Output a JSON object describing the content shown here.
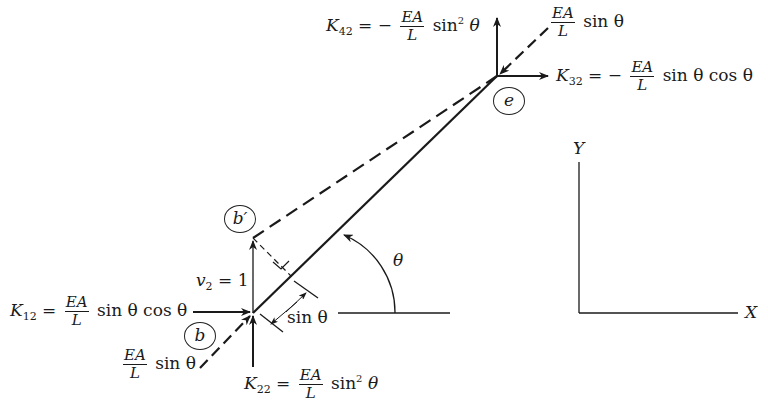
{
  "diagram": {
    "type": "truss-element-displacement",
    "nodes": {
      "b": {
        "label": "b"
      },
      "b_prime": {
        "label": "b′"
      },
      "e": {
        "label": "e"
      }
    },
    "displacement": {
      "var": "v",
      "sub": "2",
      "eq": "= 1"
    },
    "projection": {
      "text": "sin θ"
    },
    "angle": {
      "symbol": "θ"
    },
    "forces": {
      "K12": {
        "K": "K",
        "sub": "12",
        "eq": "=",
        "sign": "",
        "num": "EA",
        "den": "L",
        "tail": "sin θ cos θ"
      },
      "K22": {
        "K": "K",
        "sub": "22",
        "eq": "=",
        "sign": "",
        "num": "EA",
        "den": "L",
        "tail_pre": "sin",
        "sup": "2",
        "tail_post": "θ"
      },
      "K42": {
        "K": "K",
        "sub": "42",
        "eq": "=",
        "sign": "−",
        "num": "EA",
        "den": "L",
        "tail_pre": "sin",
        "sup": "2",
        "tail_post": "θ"
      },
      "K32": {
        "K": "K",
        "sub": "32",
        "eq": "=",
        "sign": "−",
        "num": "EA",
        "den": "L",
        "tail": "sin θ cos θ"
      },
      "axial_b": {
        "num": "EA",
        "den": "L",
        "tail": "sin θ"
      },
      "axial_e": {
        "num": "EA",
        "den": "L",
        "tail": "sin θ"
      }
    },
    "axes": {
      "x": "X",
      "y": "Y"
    },
    "colors": {
      "ink": "#1a1a1a",
      "background": "#ffffff"
    }
  }
}
